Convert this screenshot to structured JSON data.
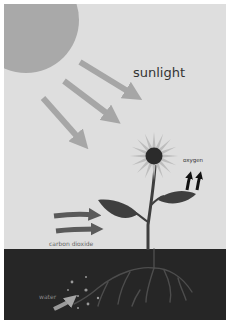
{
  "diagram": {
    "labels": {
      "sunlight": "sunlight",
      "oxygen": "oxygen",
      "carbon_dioxide": "carbon dioxide",
      "water": "water"
    },
    "colors": {
      "border": "#ffffff",
      "sky": "#dedede",
      "soil": "#262626",
      "sun": "#a9a9a9",
      "sun_rays": "#a6a6a6",
      "petals": "#bdbdbd",
      "flower_center": "#2b2b2b",
      "stem": "#3e3e3e",
      "leaf": "#3f3f3f",
      "oxygen_arrows": "#111111",
      "co2_arrows": "#5a5a5a",
      "roots": "#4a4a4a",
      "water_arrow": "#9a9a9a",
      "label_dark": "#333333",
      "label_light": "#8a8a8a"
    }
  }
}
